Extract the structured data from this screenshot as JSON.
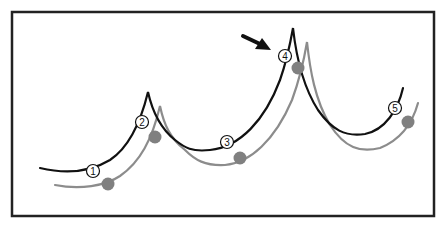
{
  "diagram": {
    "frame": {
      "x": 12,
      "y": 12,
      "width": 422,
      "height": 204,
      "stroke": "#222222"
    },
    "colors": {
      "primary_curve": "#111111",
      "secondary_curve": "#8c8c8c",
      "dot": "#808080",
      "arrow": "#111111"
    },
    "primary_curve": {
      "label": "black curve",
      "points": [
        [
          40,
          168
        ],
        [
          95,
          170
        ],
        [
          142,
          122
        ],
        [
          148,
          92
        ],
        [
          160,
          125
        ],
        [
          198,
          150
        ],
        [
          228,
          142
        ],
        [
          285,
          56
        ],
        [
          293,
          28
        ],
        [
          300,
          80
        ],
        [
          350,
          136
        ],
        [
          395,
          108
        ],
        [
          403,
          88
        ]
      ]
    },
    "secondary_curve": {
      "label": "grey curve",
      "points": [
        [
          55,
          185
        ],
        [
          108,
          184
        ],
        [
          155,
          137
        ],
        [
          160,
          106
        ],
        [
          172,
          140
        ],
        [
          210,
          165
        ],
        [
          240,
          158
        ],
        [
          298,
          68
        ],
        [
          307,
          42
        ],
        [
          316,
          100
        ],
        [
          360,
          152
        ],
        [
          408,
          122
        ],
        [
          418,
          103
        ]
      ]
    },
    "markers": [
      {
        "id": "1",
        "label": "1",
        "x": 93,
        "y": 171
      },
      {
        "id": "2",
        "label": "2",
        "x": 142,
        "y": 122
      },
      {
        "id": "3",
        "label": "3",
        "x": 227,
        "y": 142
      },
      {
        "id": "4",
        "label": "4",
        "x": 285,
        "y": 56
      },
      {
        "id": "5",
        "label": "5",
        "x": 395,
        "y": 108
      }
    ],
    "dots": [
      {
        "x": 108,
        "y": 184
      },
      {
        "x": 155,
        "y": 137
      },
      {
        "x": 240,
        "y": 158
      },
      {
        "x": 298,
        "y": 68
      },
      {
        "x": 408,
        "y": 122
      }
    ],
    "arrow": {
      "from": [
        243,
        37
      ],
      "to": [
        270,
        49
      ],
      "points_to_marker": "4"
    }
  }
}
